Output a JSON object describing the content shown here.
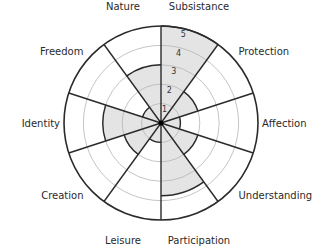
{
  "chart_data": {
    "type": "polar-area",
    "title": "",
    "categories": [
      "Subsistance",
      "Protection",
      "Affection",
      "Understanding",
      "Participation",
      "Leisure",
      "Creation",
      "Identity",
      "Freedom",
      "Nature"
    ],
    "values": [
      5,
      2,
      1,
      2,
      3.75,
      1,
      2,
      3,
      1,
      3
    ],
    "radial_ticks": [
      "1",
      "2",
      "3",
      "4",
      "5"
    ],
    "rlim": [
      0,
      5
    ],
    "grid": true,
    "start_angle_deg": 0,
    "direction": "clockwise",
    "colors": {
      "fill": "#e4e4e4",
      "line": "#2a2a2a",
      "grid": "#b5b5b5"
    }
  }
}
